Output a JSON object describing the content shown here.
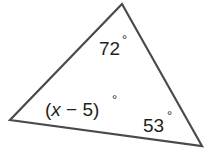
{
  "diagram": {
    "type": "triangle",
    "stroke_color": "#4a4a4a",
    "vertices": {
      "top": [
        122,
        4
      ],
      "left": [
        10,
        120
      ],
      "right": [
        202,
        146
      ]
    },
    "angles": {
      "top": {
        "value": "72",
        "degree": "°"
      },
      "left": {
        "expr_open": "(",
        "var": "x",
        "rest": " − 5)",
        "degree": "°"
      },
      "right": {
        "value": "53",
        "degree": "°"
      }
    }
  }
}
